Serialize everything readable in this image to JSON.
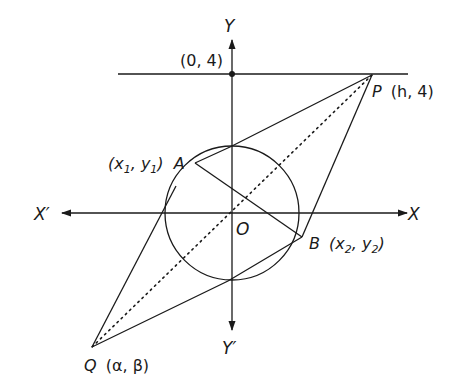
{
  "diagram": {
    "axes": {
      "x_positive": "X",
      "x_negative": "X′",
      "y_positive": "Y",
      "y_negative": "Y′",
      "origin": "O"
    },
    "line_label": "(0, 4)",
    "points": {
      "P": {
        "name": "P",
        "coords": "(h, 4)"
      },
      "Q": {
        "name": "Q",
        "coords": "(α, β)"
      },
      "A": {
        "name": "A",
        "coords_prefix": "(x",
        "sub1": "1",
        "mid": ", y",
        "sub2": "1",
        "suffix": ")"
      },
      "B": {
        "name": "B",
        "coords_prefix": "(x",
        "sub1": "2",
        "mid": ", y",
        "sub2": "2",
        "suffix": ")"
      }
    },
    "colors": {
      "stroke": "#1a1a1a",
      "background": "#ffffff"
    }
  }
}
